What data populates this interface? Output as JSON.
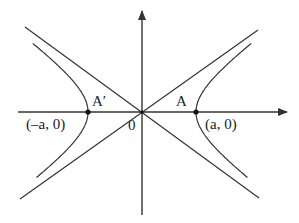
{
  "diagram": {
    "colors": {
      "stroke": "#333333",
      "background": "#ffffff",
      "text": "#222222"
    },
    "origin_px": [
      142,
      112
    ],
    "a_px": 54,
    "b_px": 39,
    "labels": {
      "origin": "0",
      "vertex_right": "A",
      "vertex_left": "A′",
      "coord_right": "(a, 0)",
      "coord_left": "(–a, 0)"
    },
    "elements": [
      "x-axis with arrow",
      "y-axis with arrow",
      "two asymptotes through origin",
      "left hyperbola branch",
      "right hyperbola branch",
      "vertex points A' and A"
    ]
  }
}
